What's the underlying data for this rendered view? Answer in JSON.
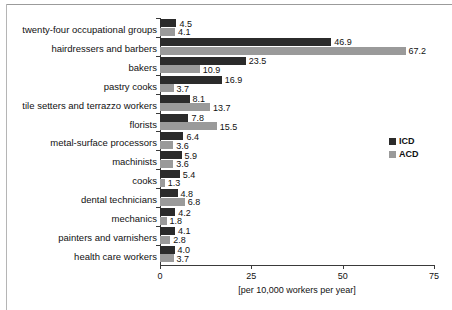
{
  "chart_data": {
    "type": "bar",
    "orientation": "horizontal",
    "title": "",
    "xlabel": "[per 10,000 workers per year]",
    "ylabel": "",
    "xlim": [
      0,
      75
    ],
    "xticks": [
      0,
      25,
      50,
      75
    ],
    "xtick_labels": [
      "0",
      "25",
      "50",
      "75"
    ],
    "grid": false,
    "legend_position": "right",
    "categories": [
      "twenty-four occupational groups",
      "hairdressers and barbers",
      "bakers",
      "pastry cooks",
      "tile setters and terrazzo workers",
      "florists",
      "metal-surface processors",
      "machinists",
      "cooks",
      "dental technicians",
      "mechanics",
      "painters and varnishers",
      "health care workers"
    ],
    "series": [
      {
        "name": "ICD",
        "color": "#2b2b2b",
        "values": [
          4.5,
          46.9,
          23.5,
          16.9,
          8.1,
          7.8,
          6.4,
          5.9,
          5.4,
          4.8,
          4.2,
          4.1,
          4.0
        ]
      },
      {
        "name": "ACD",
        "color": "#9a9a9a",
        "values": [
          4.1,
          67.2,
          10.9,
          3.7,
          13.7,
          15.5,
          3.6,
          3.6,
          1.3,
          6.8,
          1.8,
          2.8,
          3.7
        ]
      }
    ],
    "value_labels": {
      "ICD": [
        "4.5",
        "46.9",
        "23.5",
        "16.9",
        "8.1",
        "7.8",
        "6.4",
        "5.9",
        "5.4",
        "4.8",
        "4.2",
        "4.1",
        "4.0"
      ],
      "ACD": [
        "4.1",
        "67.2",
        "10.9",
        "3.7",
        "13.7",
        "15.5",
        "3.6",
        "3.6",
        "1.3",
        "6.8",
        "1.8",
        "2.8",
        "3.7"
      ]
    },
    "legend": [
      {
        "label": "ICD",
        "color": "#2b2b2b"
      },
      {
        "label": "ACD",
        "color": "#9a9a9a"
      }
    ]
  }
}
